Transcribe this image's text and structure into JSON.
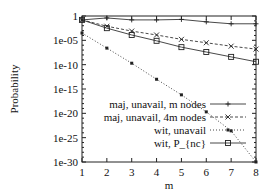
{
  "chart_data": {
    "type": "line",
    "title": "",
    "xlabel": "m",
    "ylabel": "Probability",
    "yscale": "log",
    "xlim": [
      1,
      8
    ],
    "ylim": [
      1e-30,
      1
    ],
    "grid": false,
    "legend_position": "inside lower right",
    "x": [
      1,
      2,
      3,
      4,
      5,
      6,
      7,
      8
    ],
    "x_ticks": [
      "1",
      "2",
      "3",
      "4",
      "5",
      "6",
      "7",
      "8"
    ],
    "y_ticks": [
      "1",
      "1e-05",
      "1e-10",
      "1e-15",
      "1e-20",
      "1e-25",
      "1e-30"
    ],
    "y_tick_exponents": [
      0,
      -5,
      -10,
      -15,
      -20,
      -25,
      -30
    ],
    "series": [
      {
        "name": "maj, unavail, m nodes",
        "marker": "plus",
        "linestyle": "solid",
        "log10_values": [
          -0.8,
          -0.4,
          -0.8,
          -0.8,
          -0.7,
          -1.2,
          -1.6,
          -1.6
        ],
        "values": [
          0.16,
          0.4,
          0.16,
          0.16,
          0.2,
          0.063,
          0.025,
          0.025
        ]
      },
      {
        "name": "maj, unavail, 4m nodes",
        "marker": "x",
        "linestyle": "dashed",
        "log10_values": [
          -0.8,
          -2.1,
          -3.1,
          -3.9,
          -4.8,
          -5.5,
          -6.2,
          -6.8
        ],
        "values": [
          0.16,
          0.0079,
          0.00079,
          0.00013,
          1.6e-05,
          3.2e-06,
          6.3e-07,
          1.6e-07
        ]
      },
      {
        "name": "wit, unavail",
        "marker": "filled-square",
        "linestyle": "dotted",
        "log10_values": [
          -3.5,
          -6.6,
          -9.7,
          -13.0,
          -16.2,
          -19.7,
          -23.6,
          -30.0
        ],
        "values": [
          0.00032,
          2.5e-07,
          2e-10,
          1e-13,
          6.3e-17,
          2e-20,
          2.5e-24,
          1e-30
        ]
      },
      {
        "name": "wit, P_{nc}",
        "marker": "open-square",
        "linestyle": "solid",
        "log10_values": [
          -0.8,
          -2.5,
          -3.9,
          -5.1,
          -6.4,
          -7.4,
          -8.4,
          -9.4
        ],
        "values": [
          0.16,
          0.0032,
          0.00013,
          7.9e-06,
          4e-07,
          4e-08,
          4e-09,
          4e-10
        ]
      }
    ]
  }
}
